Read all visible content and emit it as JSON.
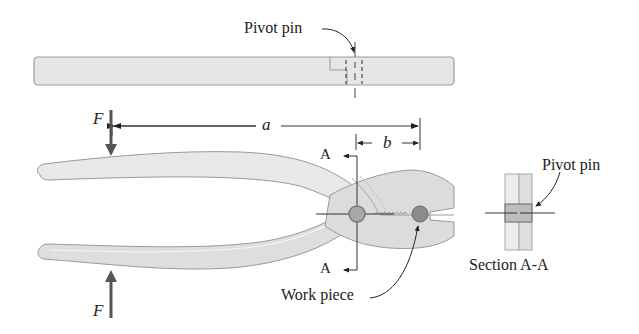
{
  "figure": {
    "top_view": {
      "pivot_label": "Pivot pin"
    },
    "dimensions": {
      "a_label": "a",
      "b_label": "b"
    },
    "forces": {
      "top_label": "F",
      "bottom_label": "F"
    },
    "section_markers": {
      "top_label": "A",
      "bottom_label": "A"
    },
    "work_piece_label": "Work piece",
    "section_view": {
      "pivot_label": "Pivot pin",
      "caption": "Section A-A"
    },
    "colors": {
      "handle_fill": "#e6e6e6",
      "handle_edge": "#9a9a9a",
      "jaw_fill": "#dcdcdc",
      "pin_fill": "#a8a8a8",
      "workpiece_fill": "#8c8c8c",
      "arrow": "#555555",
      "line": "#333333"
    }
  }
}
